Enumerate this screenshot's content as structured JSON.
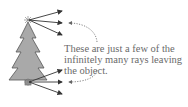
{
  "diagram": {
    "caption": "These are just a few of the infinitely many rays leaving the object.",
    "colors": {
      "tree_fill": "#a9a9a9",
      "tree_stroke": "#555555",
      "ray": "#333333",
      "dotted_arrow": "#666666",
      "text": "#6a6a6a"
    },
    "elements": [
      "tree-object",
      "top-point-source",
      "bottom-point-source",
      "top-rays",
      "bottom-rays",
      "dotted-callout-arrows"
    ]
  }
}
